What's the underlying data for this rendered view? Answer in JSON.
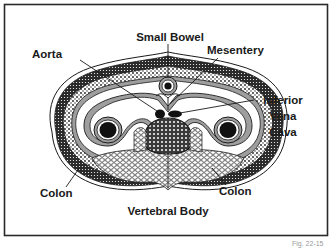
{
  "diagram": {
    "labels": {
      "small_bowel": "Small Bowel",
      "aorta": "Aorta",
      "mesentery": "Mesentery",
      "ivc_line1": "Inferior",
      "ivc_line2": "Vena",
      "ivc_line3": "Cava",
      "colon_left": "Colon",
      "colon_right": "Colon",
      "vertebral_body": "Vertebral Body"
    },
    "caption": "Fig. 22-15",
    "colors": {
      "ink": "#1a1a1a",
      "frame": "#2a2a2a",
      "gray_layer": "#9e9e9e",
      "background": "#ffffff"
    }
  }
}
